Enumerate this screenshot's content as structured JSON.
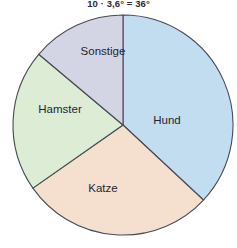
{
  "annotation": {
    "formula": "10 · 3,6° = 36°"
  },
  "chart_data": {
    "type": "pie",
    "title": "",
    "subtitle": "",
    "xlabel": "",
    "ylabel": "",
    "legend_position": "none",
    "grid": false,
    "annotations": [
      "10 · 3,6° = 36°"
    ],
    "center": {
      "x": 123,
      "y": 125
    },
    "radius": 110,
    "start_angle_deg": 0,
    "direction": "clockwise",
    "categories": [
      "Hund",
      "Katze",
      "Hamster",
      "Sonstige"
    ],
    "values": [
      37,
      28,
      21,
      14
    ],
    "angles_deg": [
      133,
      102,
      75,
      50
    ],
    "colors": [
      "#c3ddf0",
      "#f5e0d0",
      "#dcecd5",
      "#d3d5e5"
    ],
    "stroke_color": "#4a4a55",
    "slices": [
      {
        "label": "Hund",
        "value": 37,
        "angle_deg": 133,
        "start_deg": 0,
        "end_deg": 133,
        "color": "#c3ddf0",
        "label_x": 167,
        "label_y": 121
      },
      {
        "label": "Katze",
        "value": 28,
        "angle_deg": 102,
        "start_deg": 133,
        "end_deg": 235,
        "color": "#f5e0d0",
        "label_x": 103,
        "label_y": 189
      },
      {
        "label": "Hamster",
        "value": 21,
        "angle_deg": 75,
        "start_deg": 235,
        "end_deg": 310,
        "color": "#dcecd5",
        "label_x": 60,
        "label_y": 110
      },
      {
        "label": "Sonstige",
        "value": 14,
        "angle_deg": 50,
        "start_deg": 310,
        "end_deg": 360,
        "color": "#d3d5e5",
        "label_x": 103,
        "label_y": 52
      }
    ]
  }
}
